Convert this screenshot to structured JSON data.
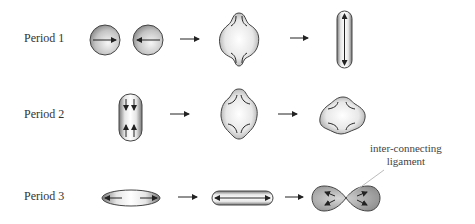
{
  "rows": [
    {
      "label": "Period 1"
    },
    {
      "label": "Period 2"
    },
    {
      "label": "Period 3"
    }
  ],
  "annotation": {
    "line1": "inter-connecting",
    "line2": "ligament"
  },
  "colors": {
    "outline": "#444444",
    "fill_dark": "#8a8a8a",
    "fill_light": "#f4f4f4",
    "arrow": "#222222",
    "leader": "#bbbbbb"
  }
}
